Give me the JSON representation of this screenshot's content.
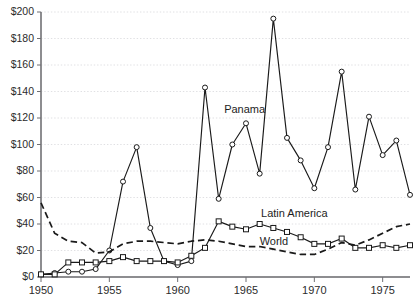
{
  "chart_data": {
    "type": "line",
    "title": "",
    "subtitle": "",
    "xlabel": "",
    "ylabel": "",
    "xlim": [
      1950,
      1977
    ],
    "ylim": [
      0,
      200
    ],
    "grid": true,
    "legend_position": "inline-annotations",
    "y_ticks": [
      0,
      20,
      40,
      60,
      80,
      100,
      120,
      140,
      160,
      180,
      200
    ],
    "y_tick_labels": [
      "$0",
      "$20",
      "$40",
      "$60",
      "$80",
      "$100",
      "$120",
      "$140",
      "$160",
      "$180",
      "$200"
    ],
    "x_ticks": [
      1950,
      1955,
      1960,
      1965,
      1970,
      1975
    ],
    "x_tick_labels": [
      "1950",
      "1955",
      "1960",
      "1965",
      "1970",
      "1975"
    ],
    "x": [
      1950,
      1951,
      1952,
      1953,
      1954,
      1955,
      1956,
      1957,
      1958,
      1959,
      1960,
      1961,
      1962,
      1963,
      1964,
      1965,
      1966,
      1967,
      1968,
      1969,
      1970,
      1971,
      1972,
      1973,
      1974,
      1975,
      1976,
      1977
    ],
    "series": [
      {
        "name": "Panama",
        "marker": "circle",
        "style": "solid",
        "color": "#1a1a1a",
        "label_x": 1963.4,
        "label_y": 124,
        "values": [
          2,
          3,
          4,
          4,
          6,
          20,
          72,
          98,
          37,
          12,
          9,
          12,
          143,
          59,
          100,
          116,
          78,
          195,
          105,
          88,
          67,
          98,
          155,
          66,
          121,
          92,
          103,
          62
        ]
      },
      {
        "name": "Latin America",
        "marker": "square",
        "style": "solid",
        "color": "#1a1a1a",
        "label_x": 1966.1,
        "label_y": 45,
        "values": [
          2,
          2,
          11,
          11,
          11,
          12,
          15,
          12,
          12,
          12,
          11,
          16,
          22,
          42,
          38,
          36,
          40,
          37,
          34,
          30,
          25,
          25,
          29,
          22,
          22,
          24,
          22,
          24
        ]
      },
      {
        "name": "World",
        "marker": "none",
        "style": "dashed",
        "color": "#1a1a1a",
        "label_x": 1966.0,
        "label_y": 24,
        "values": [
          56,
          33,
          27,
          26,
          18,
          19,
          25,
          27,
          27,
          26,
          25,
          27,
          28,
          27,
          25,
          23,
          23,
          21,
          19,
          17,
          17,
          21,
          26,
          24,
          28,
          33,
          38,
          40
        ]
      }
    ]
  }
}
